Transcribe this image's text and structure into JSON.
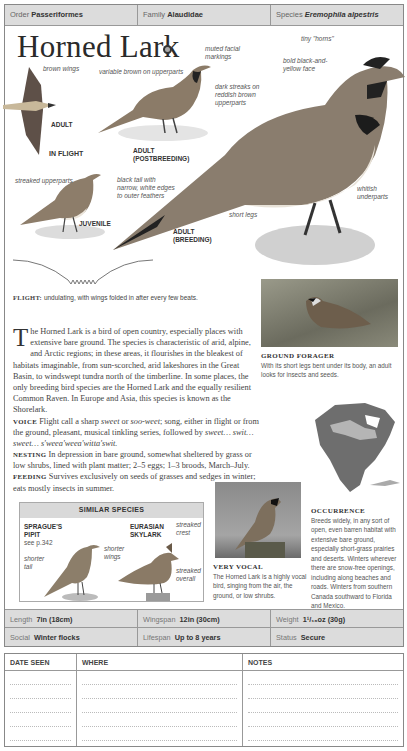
{
  "taxonomy": {
    "order_label": "Order",
    "order_value": "Passeriformes",
    "family_label": "Family",
    "family_value": "Alaudidae",
    "species_label": "Species",
    "species_value": "Eremophila alpestris"
  },
  "title": "Horned Lark",
  "audio_icon": "audio-icon",
  "illustrations": {
    "flight": {
      "label": "IN FLIGHT",
      "sub_label": "ADULT",
      "annotation": "brown wings"
    },
    "postbreeding": {
      "label_line1": "ADULT",
      "label_line2": "(POSTBREEDING)",
      "annotation1": "variable brown on upperparts",
      "annotation2": "muted facial markings"
    },
    "juvenile": {
      "label": "JUVENILE",
      "annotation": "streaked upperparts"
    },
    "breeding": {
      "label_line1": "ADULT",
      "label_line2": "(BREEDING)",
      "annotations": {
        "horns": "tiny \"horns\"",
        "face": "bold black-and-yellow face",
        "streaks": "dark streaks on reddish brown upperparts",
        "tail": "black tail with narrow, white edges to outer feathers",
        "underparts": "whitish underparts",
        "legs": "short legs"
      }
    }
  },
  "flight": {
    "label": "FLIGHT:",
    "text": "undulating, with wings folded in after every few beats."
  },
  "description": {
    "dropcap": "T",
    "intro": "he Horned Lark is a bird of open country, especially places with extensive bare ground. The species is characteristic of arid, alpine, and Arctic regions; in these areas, it flourishes in the bleakest of habitats imaginable, from sun-scorched, arid lakeshores in the Great Basin, to windswept tundra north of the timberline. In some places, the only breeding bird species are the Horned Lark and the equally resilient Common Raven. In Europe and Asia, this species is known as the Shorelark.",
    "voice_label": "VOICE",
    "voice_text_1": "Flight call a sharp ",
    "voice_italic_1": "sweet",
    "voice_text_2": " or ",
    "voice_italic_2": "soo-weet",
    "voice_text_3": "; song, either in flight or from the ground, pleasant, musical tinkling series, followed by ",
    "voice_italic_3": "sweet… swit… sweet… s'weea'weea'witta'swit.",
    "nesting_label": "NESTING",
    "nesting_text": "In depression in bare ground, somewhat sheltered by grass or low shrubs, lined with plant matter; 2–5 eggs; 1–3 broods, March–July.",
    "feeding_label": "FEEDING",
    "feeding_text": "Survives exclusively on seeds of grasses and sedges in winter; eats mostly insects in summer."
  },
  "ground_forager": {
    "title": "GROUND FORAGER",
    "text": "With its short legs bent under its body, an adult looks for insects and seeds."
  },
  "similar_species": {
    "heading": "SIMILAR SPECIES",
    "species": [
      {
        "name_line1": "SPRAGUE'S",
        "name_line2": "PIPIT",
        "ref": "see p.342",
        "annotations": [
          "shorter wings",
          "shorter tail"
        ]
      },
      {
        "name_line1": "EURASIAN",
        "name_line2": "SKYLARK",
        "annotations": [
          "streaked crest",
          "streaked overall"
        ]
      }
    ]
  },
  "very_vocal": {
    "title": "VERY VOCAL",
    "text": "The Horned Lark is a highly vocal bird, singing from the air, the ground, or low shrubs."
  },
  "occurrence": {
    "title": "OCCURRENCE",
    "text": "Breeds widely, in any sort of open, even barren habitat with extensive bare ground, especially short-grass prairies and deserts. Winters wherever there are snow-free openings, including along beaches and roads. Winters from southern Canada southward to Florida and Mexico."
  },
  "stats": {
    "length_label": "Length",
    "length_value": "7in (18cm)",
    "wingspan_label": "Wingspan",
    "wingspan_value": "12in (30cm)",
    "weight_label": "Weight",
    "weight_value": "1¹/₁₆oz (30g)",
    "social_label": "Social",
    "social_value": "Winter flocks",
    "lifespan_label": "Lifespan",
    "lifespan_value": "Up to 8 years",
    "status_label": "Status",
    "status_value": "Secure"
  },
  "log": {
    "date_header": "DATE SEEN",
    "where_header": "WHERE",
    "notes_header": "NOTES"
  },
  "colors": {
    "header_bg": "#dcdcdc",
    "border": "#999999",
    "map_range": "#6e6e6e",
    "map_breeding": "#b5b5b5"
  }
}
